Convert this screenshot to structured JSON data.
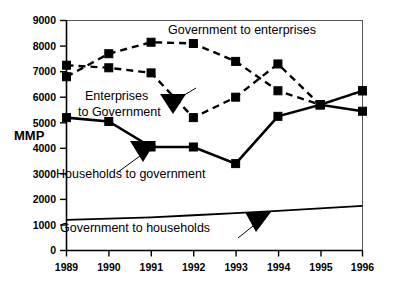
{
  "chart_data": {
    "type": "line",
    "title": "",
    "xlabel": "",
    "ylabel": "MMP",
    "x": [
      "1989",
      "1990",
      "1991",
      "1992",
      "1993",
      "1994",
      "1995",
      "1996"
    ],
    "ylim": [
      0,
      9000
    ],
    "xlim": [
      "1989",
      "1996"
    ],
    "ytick_labels": [
      "0",
      "1000",
      "2000",
      "3000",
      "4000",
      "5000",
      "6000",
      "7000",
      "8000",
      "9000"
    ],
    "ytick_values": [
      0,
      1000,
      2000,
      3000,
      4000,
      5000,
      6000,
      7000,
      8000,
      9000
    ],
    "xtick_labels": [
      "1989",
      "1990",
      "1991",
      "1992",
      "1993",
      "1994",
      "1995",
      "1996"
    ],
    "grid": false,
    "legend": "inline-annotations",
    "series": [
      {
        "name": "Government to enterprises",
        "style": "dashed",
        "marker": "square",
        "values": [
          6800,
          7700,
          8150,
          8100,
          7400,
          6250,
          5700,
          6250
        ]
      },
      {
        "name": "Enterprises to Government",
        "style": "dashed",
        "marker": "square",
        "values": [
          7250,
          7150,
          6950,
          5200,
          6000,
          7300,
          5700,
          6250
        ]
      },
      {
        "name": "Households to government",
        "style": "solid",
        "marker": "square",
        "values": [
          5200,
          5050,
          4050,
          4050,
          3400,
          5250,
          5700,
          5450
        ]
      },
      {
        "name": "Government to households",
        "style": "solid-thin",
        "marker": "none",
        "values": [
          1200,
          1250,
          1300,
          1380,
          1460,
          1550,
          1650,
          1750
        ]
      }
    ],
    "annotations": [
      {
        "text": "Government to  enterprises",
        "series": "Government to enterprises"
      },
      {
        "text": "Enterprises",
        "series": "Enterprises to Government"
      },
      {
        "text": "to Government",
        "series": "Enterprises to Government"
      },
      {
        "text": "Households to government",
        "series": "Households to government"
      },
      {
        "text": "Government to households",
        "series": "Government to households"
      }
    ]
  },
  "axis": {
    "y_title": "MMP"
  },
  "colors": {
    "ink": "#000000",
    "frame": "#555555",
    "background": "#ffffff"
  }
}
